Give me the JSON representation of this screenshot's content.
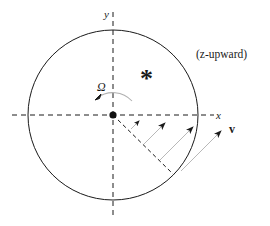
{
  "diagram": {
    "labels": {
      "y_axis": "y",
      "x_axis": "x",
      "omega": "Ω",
      "star": "*",
      "orientation": "(z-upward)",
      "velocity": "v"
    },
    "colors": {
      "stroke": "#1a1a1a",
      "arrow_shaft": "#b8b8b8",
      "rotation_arc": "#b0b0b0",
      "background": "#ffffff"
    },
    "circle": {
      "cx": 113,
      "cy": 115,
      "r": 85
    },
    "axes": {
      "x": {
        "x1": 12,
        "y1": 115,
        "x2": 214,
        "y2": 115
      },
      "y": {
        "x1": 113,
        "y1": 12,
        "x2": 113,
        "y2": 218
      }
    },
    "radial_line": {
      "x1": 113,
      "y1": 115,
      "x2": 173,
      "y2": 174
    },
    "velocity_arrows": [
      {
        "x1": 130,
        "y1": 131,
        "x2": 137,
        "y2": 124
      },
      {
        "x1": 144,
        "y1": 145,
        "x2": 165,
        "y2": 124
      },
      {
        "x1": 160,
        "y1": 160,
        "x2": 192,
        "y2": 128
      },
      {
        "x1": 181,
        "y1": 170,
        "x2": 221,
        "y2": 130
      }
    ]
  }
}
